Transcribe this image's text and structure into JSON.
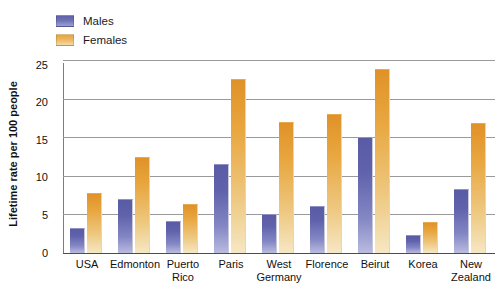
{
  "legend": {
    "position": "top-left",
    "entries": [
      {
        "label": "Males",
        "color": "#6063ab",
        "key": "males"
      },
      {
        "label": "Females",
        "color": "#e8a63f",
        "key": "females"
      }
    ]
  },
  "chart_data": {
    "type": "bar",
    "title": "",
    "xlabel": "",
    "ylabel": "Lifetime rate per 100 people",
    "ylim": [
      0,
      25
    ],
    "yticks": [
      0,
      5,
      10,
      15,
      20,
      25
    ],
    "grid": true,
    "categories": [
      "USA",
      "Edmonton",
      "Puerto Rico",
      "Paris",
      "West Germany",
      "Florence",
      "Beirut",
      "Korea",
      "New Zealand"
    ],
    "category_lines": [
      [
        "USA"
      ],
      [
        "Edmonton"
      ],
      [
        "Puerto",
        "Rico"
      ],
      [
        "Paris"
      ],
      [
        "West",
        "Germany"
      ],
      [
        "Florence"
      ],
      [
        "Beirut"
      ],
      [
        "Korea"
      ],
      [
        "New",
        "Zealand"
      ]
    ],
    "series": [
      {
        "name": "Males",
        "color": "#6063ab",
        "values": [
          3.2,
          7.0,
          4.1,
          11.5,
          5.0,
          6.1,
          15.0,
          2.3,
          8.3
        ]
      },
      {
        "name": "Females",
        "color": "#e8a63f",
        "values": [
          7.8,
          12.4,
          6.3,
          22.6,
          17.0,
          18.0,
          23.8,
          4.0,
          16.8
        ]
      }
    ]
  }
}
